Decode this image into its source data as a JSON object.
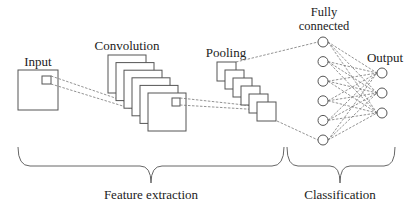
{
  "diagram": {
    "stages": {
      "input": {
        "label": "Input",
        "maps": 1
      },
      "convolution": {
        "label": "Convolution",
        "maps": 6
      },
      "pooling": {
        "label": "Pooling",
        "maps": 6
      },
      "fully_connected": {
        "label_line1": "Fully",
        "label_line2": "connected",
        "nodes": 6
      },
      "output": {
        "label": "Output",
        "nodes": 3
      }
    },
    "groups": {
      "feature_extraction": "Feature extraction",
      "classification": "Classification"
    },
    "colors": {
      "stroke": "#555555",
      "dashed": "#777777",
      "text": "#222222",
      "background": "#ffffff"
    }
  }
}
